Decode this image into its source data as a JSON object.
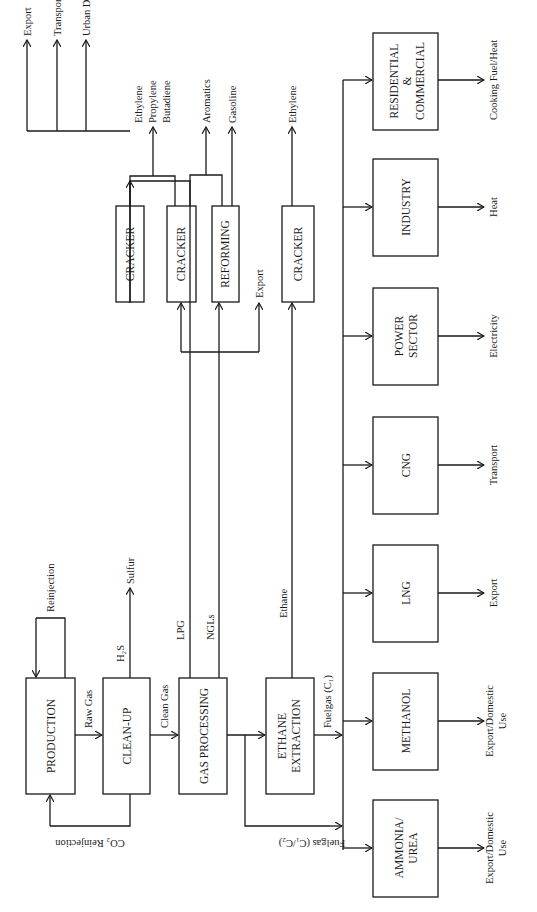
{
  "diagram": {
    "orientation": "rotated-90-ccw",
    "boxes": {
      "production": "PRODUCTION",
      "cleanup": "CLEAN-UP",
      "gas_processing": "GAS PROCESSING",
      "ethane_extraction_1": "ETHANE",
      "ethane_extraction_2": "EXTRACTION",
      "cracker_1": "CRACKER",
      "cracker_2": "CRACKER",
      "reforming": "REFORMING",
      "cracker_3": "CRACKER",
      "ammonia_urea_1": "AMMONIA/",
      "ammonia_urea_2": "UREA",
      "methanol": "METHANOL",
      "lng": "LNG",
      "cng": "CNG",
      "power_1": "POWER",
      "power_2": "SECTOR",
      "industry": "INDUSTRY",
      "residential_1": "RESIDENTIAL",
      "residential_2": "&",
      "residential_3": "COMMERCIAL"
    },
    "labels": {
      "reinjection": "Reinjection",
      "raw_gas": "Raw Gas",
      "co2_reinjection": "CO₂ Reinjection",
      "h2s": "H₂S",
      "sulfur": "Sulfur",
      "clean_gas": "Clean Gas",
      "lpg": "LPG",
      "ngls": "NGLs",
      "ethane": "Ethane",
      "fuelgas_c1": "Fuelgas (C₁)",
      "fuelgas_c1c2": "Fuelgas (C₁/C₂)",
      "export_1": "Export",
      "transport_1": "Transport",
      "urban_domestic_fund": "Urban Domestic Fund",
      "export_2": "Export",
      "ethylene_1": "Ethylene",
      "propylene": "Propylene",
      "butadiene": "Butadiene",
      "aromatics": "Aromatics",
      "gasoline": "Gasoline",
      "ethylene_2": "Ethylene",
      "out_ammonia_1": "Export/Domestic",
      "out_ammonia_2": "Use",
      "out_methanol_1": "Export/Domestic",
      "out_methanol_2": "Use",
      "out_lng": "Export",
      "out_cng": "Transport",
      "out_power": "Electricity",
      "out_industry": "Heat",
      "out_residential": "Cooking Fuel/Heat"
    }
  }
}
